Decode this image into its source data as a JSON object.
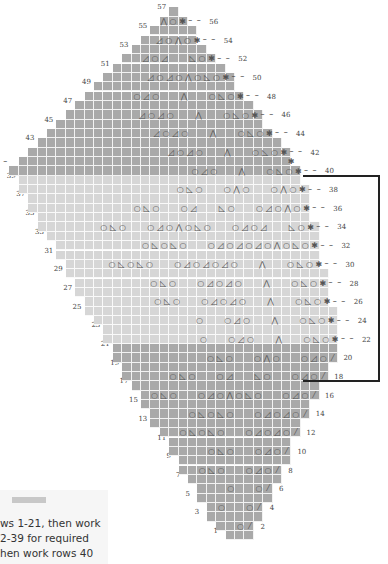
{
  "chart_data": {
    "type": "knitting-lace-chart",
    "title": "",
    "total_rows": 57,
    "odd_row_labels_left": [
      "1",
      "3",
      "5",
      "7",
      "9",
      "11",
      "13",
      "15",
      "17",
      "19",
      "21",
      "23",
      "25",
      "27",
      "29",
      "31",
      "33",
      "35",
      "37",
      "39",
      "41",
      "43",
      "45",
      "47",
      "49",
      "51",
      "53",
      "55",
      "57"
    ],
    "even_row_labels_right": [
      "2",
      "4",
      "6",
      "8",
      "10",
      "12",
      "14",
      "16",
      "18",
      "20",
      "22",
      "24",
      "26",
      "28",
      "30",
      "32",
      "34",
      "36",
      "38",
      "40",
      "42",
      "44",
      "46",
      "48",
      "50",
      "52",
      "54",
      "56"
    ],
    "sections": [
      {
        "name": "lower",
        "rows": "1-21",
        "shade": "#a9a9a9"
      },
      {
        "name": "middle-repeat",
        "rows": "22-39",
        "shade": "#d6d6d6",
        "bracketed": true
      },
      {
        "name": "upper",
        "rows": "40-57",
        "shade": "#a9a9a9"
      }
    ],
    "symbols": {
      "yo": "○",
      "k2tog": "◿",
      "ssk": "◺",
      "s2kp": "⋀",
      "k2tog_edge": "⁄",
      "edge_star": "✱"
    },
    "row_patterns": {
      "2": "○⁄",
      "4": "○ ○⁄",
      "6": "○ ○⁄",
      "8": "○◺○ ○◿○⁄",
      "10": "○◺○ ○◿○⁄",
      "12": "○◺○◺○ ○◿○◿○⁄",
      "14": "○◺○◺○ ○◿○◿○⁄",
      "16": "○◺○ ○◿○⋀○◺○ ○◿○⁄",
      "18": "○◺○ ○◿ ◺○ ○◿○⁄",
      "20": "○◺○ ○⋀○ ○◿○⁄",
      "22": "○ ○◿○ ⋀ ○◺○✱",
      "24": "○ ○◿○ ⋀ ○◺○✱",
      "26": "○◺○ ○◿○◿○ ⋀ ○◺○✱",
      "28": "○◺○ ○◿○◿○ ⋀ ○◺○✱",
      "30": "○◺○◺○ ○◿○◿○◿○ ⋀ ○◺○✱",
      "32": "○◺○◺○ ○◿○◿○◿○⋀○◺○✱",
      "34": "○◺○ ○◿○⋀○◺○ ○◿○◿ ◺○✱",
      "36": "○◺○ ○◿ ◺○ ○◿○⋀○✱",
      "38": "○◺○ ○⋀○ ○⋀○✱",
      "40": "○◿○ ⋀ ○◺○✱",
      "41": "✱",
      "42": "◿○◿○ ⋀ ○◺○✱",
      "44": "◿○◿○ ⋀ ○◺○✱",
      "46": "◿○◿○ ⋀ ○◺○✱",
      "48": "○◿○ ⋀ ○◺○✱",
      "50": "◿○◿○⋀○◺○✱",
      "52": "◿○◿ ◺○✱",
      "54": "◿○⋀○✱",
      "56": "⋀○✱"
    }
  },
  "note": {
    "text": "ws 1-21, then work\n2-39 for required\nhen work rows 40"
  }
}
